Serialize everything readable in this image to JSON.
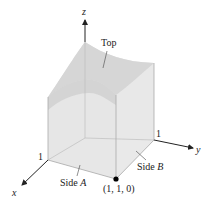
{
  "figure": {
    "labels": {
      "top": "Top",
      "side_a_prefix": "Side ",
      "side_a_letter": "A",
      "side_b_prefix": "Side ",
      "side_b_letter": "B",
      "point": "(1, 1, 0)"
    },
    "axes": {
      "x": {
        "label": "x",
        "tick": "1"
      },
      "y": {
        "label": "y",
        "tick": "1"
      },
      "z": {
        "label": "z"
      }
    },
    "colors": {
      "surface_top": "#d9d9d9",
      "surface_inner": "#c4c4c4",
      "side_face": "#e6e6e6",
      "floor": "#ececec",
      "axis": "#222222",
      "point": "#000000"
    }
  }
}
